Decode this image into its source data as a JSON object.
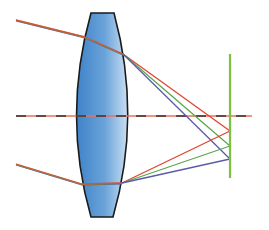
{
  "diagram": {
    "colors": {
      "background": "#ffffff",
      "lens_fill_light": "#c9dff3",
      "lens_fill_dark": "#3f83c9",
      "lens_outline": "#1a1a1a",
      "axis_dash_red": "#e8705a",
      "axis_dash_dark": "#333333",
      "incoming_ray": "#c06a3a",
      "red": "#e0452e",
      "green": "#5aa84a",
      "blue": "#5a5aa8",
      "image_plane": "#7cc242"
    },
    "lens": {
      "label": "lens",
      "top_flat": [
        91,
        13,
        114,
        13
      ],
      "bottom_flat": [
        91,
        217,
        113,
        217
      ],
      "left_bulge_x": 74,
      "right_bulge_x": 131
    },
    "optical_axis": {
      "label": "optical axis",
      "y": 116,
      "x1": 16,
      "x2": 252
    },
    "image_plane": {
      "label": "image plane",
      "x": 230,
      "y1": 54,
      "y2": 178
    },
    "rays": [
      {
        "name": "upper-incoming",
        "points": [
          [
            16,
            20
          ],
          [
            85,
            37
          ],
          [
            123,
            54
          ]
        ]
      },
      {
        "name": "lower-incoming",
        "points": [
          [
            16,
            164
          ],
          [
            82,
            184
          ],
          [
            122,
            183
          ]
        ]
      }
    ],
    "refracted": {
      "upper": [
        {
          "color": "red",
          "from": [
            123,
            54
          ],
          "to": [
            230,
            131
          ]
        },
        {
          "color": "green",
          "from": [
            123,
            54
          ],
          "to": [
            230,
            146
          ]
        },
        {
          "color": "blue",
          "from": [
            123,
            54
          ],
          "to": [
            230,
            159
          ]
        }
      ],
      "lower": [
        {
          "color": "red",
          "from": [
            122,
            183
          ],
          "to": [
            230,
            131
          ]
        },
        {
          "color": "green",
          "from": [
            122,
            183
          ],
          "to": [
            230,
            146
          ]
        },
        {
          "color": "blue",
          "from": [
            122,
            183
          ],
          "to": [
            230,
            159
          ]
        }
      ]
    }
  }
}
